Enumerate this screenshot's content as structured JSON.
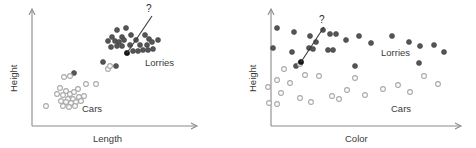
{
  "figure": {
    "width": 476,
    "height": 148,
    "background": "#ffffff",
    "colors": {
      "lorry_fill": "#555555",
      "lorry_stroke": "#3f3f3f",
      "car_fill": "#ffffff",
      "car_stroke": "#a9a9a9",
      "highlight_fill": "#1a1a1a",
      "highlight_stroke": "#000000",
      "axis": "#8a8a8a",
      "text": "#3a3a3a"
    }
  },
  "panels": [
    {
      "id": "left-panel",
      "name": "length-vs-height-scatter",
      "xlabel": "Length",
      "ylabel": "Height",
      "cluster_labels": [
        {
          "text": "Lorries",
          "x": 145,
          "y": 66
        },
        {
          "text": "Cars",
          "x": 82,
          "y": 110
        }
      ],
      "question_mark": {
        "text": "?",
        "x": 146,
        "y": 12
      },
      "pointer": {
        "x1": 152,
        "y1": 16,
        "x2": 127,
        "y2": 53
      },
      "axes": {
        "origin_x": 32,
        "origin_y": 126,
        "x_end": 196,
        "y_top": 10
      }
    },
    {
      "id": "right-panel",
      "name": "color-vs-height-scatter",
      "xlabel": "Color",
      "ylabel": "Height",
      "cluster_labels": [
        {
          "text": "Lorries",
          "x": 385,
          "y": 53
        },
        {
          "text": "Cars",
          "x": 395,
          "y": 110
        }
      ],
      "question_mark": {
        "text": "?",
        "x": 320,
        "y": 23
      },
      "pointer": {
        "x1": 324,
        "y1": 27,
        "x2": 301,
        "y2": 62
      },
      "axes": {
        "origin_x": 271,
        "origin_y": 126,
        "x_end": 460,
        "y_top": 10
      }
    }
  ],
  "chart_data": {
    "type": "scatter",
    "title": "",
    "panels": [
      {
        "name": "Length vs Height",
        "xlabel": "Length",
        "ylabel": "Height",
        "legend": [
          "Lorries",
          "Cars"
        ],
        "annotations": [
          "?"
        ],
        "grid": false,
        "series": [
          {
            "name": "Lorries",
            "marker": "filled-circle",
            "color": "#555555",
            "points": [
              [
                117,
                30
              ],
              [
                126,
                28
              ],
              [
                112,
                37
              ],
              [
                122,
                37
              ],
              [
                131,
                35
              ],
              [
                108,
                41
              ],
              [
                115,
                41
              ],
              [
                119,
                42
              ],
              [
                124,
                40
              ],
              [
                136,
                40
              ],
              [
                145,
                35
              ],
              [
                149,
                39
              ],
              [
                111,
                47
              ],
              [
                117,
                46
              ],
              [
                122,
                46
              ],
              [
                130,
                45
              ],
              [
                140,
                45
              ],
              [
                147,
                45
              ],
              [
                152,
                42
              ],
              [
                158,
                40
              ],
              [
                133,
                51
              ],
              [
                138,
                51
              ],
              [
                143,
                50
              ],
              [
                148,
                50
              ],
              [
                153,
                49
              ],
              [
                103,
                62
              ],
              [
                116,
                66
              ],
              [
                74,
                73
              ]
            ]
          },
          {
            "name": "Cars",
            "marker": "open-circle",
            "color": "#a9a9a9",
            "points": [
              [
                64,
                77
              ],
              [
                70,
                76
              ],
              [
                86,
                84
              ],
              [
                96,
                84
              ],
              [
                78,
                89
              ],
              [
                60,
                88
              ],
              [
                66,
                91
              ],
              [
                57,
                94
              ],
              [
                63,
                95
              ],
              [
                70,
                94
              ],
              [
                74,
                92
              ],
              [
                68,
                99
              ],
              [
                73,
                99
              ],
              [
                79,
                97
              ],
              [
                84,
                96
              ],
              [
                61,
                101
              ],
              [
                66,
                102
              ],
              [
                71,
                103
              ],
              [
                76,
                102
              ],
              [
                81,
                101
              ],
              [
                63,
                106
              ],
              [
                69,
                107
              ],
              [
                75,
                106
              ],
              [
                46,
                106
              ],
              [
                108,
                69
              ],
              [
                110,
                66
              ]
            ]
          },
          {
            "name": "Unknown",
            "marker": "filled-circle-dark",
            "color": "#1a1a1a",
            "points": [
              [
                127,
                53
              ]
            ]
          }
        ]
      },
      {
        "name": "Color vs Height",
        "xlabel": "Color",
        "ylabel": "Height",
        "legend": [
          "Lorries",
          "Cars"
        ],
        "annotations": [
          "?"
        ],
        "grid": false,
        "series": [
          {
            "name": "Lorries",
            "marker": "filled-circle",
            "color": "#555555",
            "points": [
              [
                277,
                28
              ],
              [
                294,
                32
              ],
              [
                316,
                42
              ],
              [
                310,
                36
              ],
              [
                323,
                30
              ],
              [
                309,
                48
              ],
              [
                313,
                49
              ],
              [
                330,
                34
              ],
              [
                336,
                34
              ],
              [
                346,
                40
              ],
              [
                328,
                50
              ],
              [
                333,
                50
              ],
              [
                292,
                52
              ],
              [
                273,
                48
              ],
              [
                359,
                36
              ],
              [
                371,
                43
              ],
              [
                392,
                36
              ],
              [
                409,
                42
              ],
              [
                420,
                46
              ],
              [
                434,
                45
              ],
              [
                444,
                52
              ],
              [
                419,
                63
              ],
              [
                296,
                66
              ],
              [
                355,
                66
              ]
            ]
          },
          {
            "name": "Cars",
            "marker": "open-circle",
            "color": "#a9a9a9",
            "points": [
              [
                284,
                69
              ],
              [
                305,
                75
              ],
              [
                300,
                64
              ],
              [
                319,
                76
              ],
              [
                355,
                78
              ],
              [
                277,
                80
              ],
              [
                290,
                83
              ],
              [
                268,
                87
              ],
              [
                281,
                93
              ],
              [
                300,
                98
              ],
              [
                332,
                96
              ],
              [
                339,
                99
              ],
              [
                365,
                95
              ],
              [
                383,
                89
              ],
              [
                398,
                85
              ],
              [
                410,
                92
              ],
              [
                269,
                103
              ],
              [
                277,
                104
              ],
              [
                311,
                102
              ],
              [
                347,
                90
              ],
              [
                424,
                76
              ],
              [
                438,
                84
              ]
            ]
          },
          {
            "name": "Unknown",
            "marker": "filled-circle-dark",
            "color": "#1a1a1a",
            "points": [
              [
                301,
                62
              ]
            ]
          }
        ]
      }
    ]
  }
}
